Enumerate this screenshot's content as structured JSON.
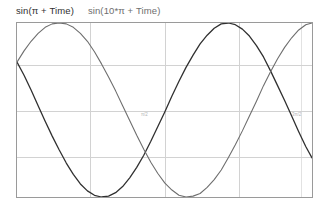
{
  "legend": {
    "entries": [
      {
        "label": "sin(π + Time)",
        "color": "#303030"
      },
      {
        "label": "sin(10*π + Time)",
        "color": "#6e6e6e"
      }
    ]
  },
  "axes": {
    "x_tick_labels": [
      "π/2",
      "3π/2"
    ],
    "y_tick_labels": []
  },
  "chart_data": {
    "type": "line",
    "title": "",
    "xlabel": "",
    "ylabel": "",
    "xlim": [
      0,
      12.566
    ],
    "ylim": [
      -1,
      1
    ],
    "grid": true,
    "legend_position": "top-left",
    "x_gridlines": [
      3.1416,
      6.2832,
      9.4248
    ],
    "y_gridlines": [
      -0.5,
      0,
      0.5
    ],
    "annotations": [
      {
        "text": "π/2",
        "x": 6.2832,
        "y": 0
      },
      {
        "text": "3π/2",
        "x": 11.78,
        "y": 0
      }
    ],
    "series": [
      {
        "name": "sin(π + Time)",
        "color": "#303030",
        "x": [
          0.0,
          0.3,
          0.6,
          0.9,
          1.2,
          1.5,
          1.8,
          2.1,
          2.4,
          2.7,
          3.0,
          3.3,
          3.6,
          3.9,
          4.2,
          4.5,
          4.8,
          5.1,
          5.4,
          5.7,
          6.0,
          6.3,
          6.6,
          6.9,
          7.2,
          7.5,
          7.8,
          8.1,
          8.4,
          8.7,
          9.0,
          9.3,
          9.6,
          9.9,
          10.2,
          10.5,
          10.8,
          11.1,
          11.4,
          11.7,
          12.0,
          12.3,
          12.566
        ],
        "y": [
          0.55,
          0.4,
          0.23,
          0.05,
          -0.13,
          -0.3,
          -0.46,
          -0.61,
          -0.74,
          -0.85,
          -0.93,
          -0.98,
          -1.0,
          -0.99,
          -0.95,
          -0.88,
          -0.78,
          -0.66,
          -0.52,
          -0.36,
          -0.19,
          -0.02,
          0.16,
          0.33,
          0.49,
          0.63,
          0.76,
          0.86,
          0.94,
          0.99,
          1.0,
          0.98,
          0.93,
          0.85,
          0.74,
          0.61,
          0.45,
          0.28,
          0.11,
          -0.07,
          -0.25,
          -0.42,
          -0.55
        ]
      },
      {
        "name": "sin(10*π + Time)",
        "color": "#6e6e6e",
        "x": [
          0.0,
          0.3,
          0.6,
          0.9,
          1.2,
          1.5,
          1.8,
          2.1,
          2.4,
          2.7,
          3.0,
          3.3,
          3.6,
          3.9,
          4.2,
          4.5,
          4.8,
          5.1,
          5.4,
          5.7,
          6.0,
          6.3,
          6.6,
          6.9,
          7.2,
          7.5,
          7.8,
          8.1,
          8.4,
          8.7,
          9.0,
          9.3,
          9.6,
          9.9,
          10.2,
          10.5,
          10.8,
          11.1,
          11.4,
          11.7,
          12.0,
          12.3,
          12.566
        ],
        "y": [
          0.55,
          0.68,
          0.79,
          0.88,
          0.95,
          0.99,
          1.0,
          0.99,
          0.95,
          0.88,
          0.79,
          0.67,
          0.53,
          0.38,
          0.22,
          0.05,
          -0.12,
          -0.29,
          -0.45,
          -0.6,
          -0.73,
          -0.84,
          -0.92,
          -0.98,
          -1.0,
          -0.99,
          -0.96,
          -0.89,
          -0.8,
          -0.69,
          -0.55,
          -0.4,
          -0.24,
          -0.07,
          0.1,
          0.28,
          0.44,
          0.59,
          0.72,
          0.83,
          0.92,
          0.98,
          1.0
        ]
      }
    ]
  }
}
